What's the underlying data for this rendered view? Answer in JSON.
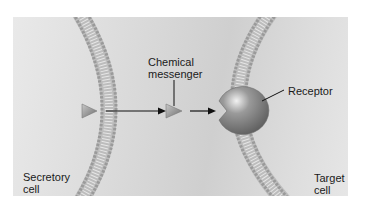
{
  "diagram": {
    "labels": {
      "chemical_messenger_line1": "Chemical",
      "chemical_messenger_line2": "messenger",
      "receptor": "Receptor",
      "secretory_cell_line1": "Secretory",
      "secretory_cell_line2": "cell",
      "target_cell_line1": "Target",
      "target_cell_line2": "cell"
    },
    "elements": [
      {
        "id": "secretory-membrane",
        "type": "lipid-bilayer"
      },
      {
        "id": "target-membrane",
        "type": "lipid-bilayer"
      },
      {
        "id": "messenger-released",
        "type": "triangle"
      },
      {
        "id": "messenger-in-transit",
        "type": "triangle"
      },
      {
        "id": "receptor",
        "type": "notched-sphere"
      },
      {
        "id": "arrow-1",
        "type": "arrow",
        "from": "messenger-released",
        "to": "messenger-in-transit"
      },
      {
        "id": "arrow-2",
        "type": "arrow",
        "from": "messenger-in-transit",
        "to": "receptor"
      }
    ],
    "colors": {
      "background": "#d8d8d8",
      "membrane": "#b5b5b5",
      "messenger": "#8c8c8c",
      "receptor": "#7a7a7a",
      "text": "#1a1a1a"
    }
  }
}
